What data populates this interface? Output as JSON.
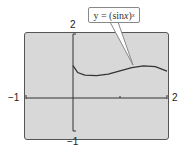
{
  "chart_data": {
    "type": "line",
    "title": "",
    "annotation": "y = (sin x)^x",
    "annotation_parts": {
      "lhs": "y = (sin ",
      "var": "x",
      "rhs": ")",
      "exponent": "x"
    },
    "xlabel": "",
    "ylabel": "",
    "xlim": [
      -1,
      2
    ],
    "ylim": [
      -1,
      2
    ],
    "x_tick_labels": [
      "-1",
      "2"
    ],
    "y_tick_labels": [
      "2",
      "-1"
    ],
    "grid": false,
    "series": [
      {
        "name": "y = (sin x)^x",
        "x": [
          0.0,
          0.1,
          0.25,
          0.5,
          0.75,
          1.0,
          1.25,
          1.5,
          1.75,
          2.0
        ],
        "y": [
          1.0,
          0.79,
          0.71,
          0.69,
          0.74,
          0.84,
          0.94,
          0.995,
          0.97,
          0.83
        ]
      }
    ]
  },
  "labels": {
    "x_min": "−1",
    "x_max": "2",
    "y_max": "2",
    "y_min": "−1"
  },
  "colors": {
    "screen_bg": "#d8d8d8",
    "curve": "#333333",
    "axis": "#333333"
  }
}
